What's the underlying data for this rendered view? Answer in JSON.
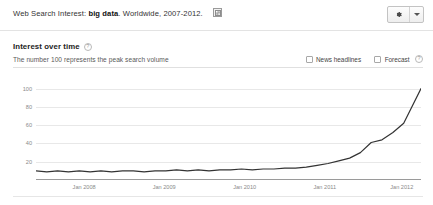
{
  "header": {
    "title_prefix": "Web Search Interest:",
    "keyword": "big data",
    "title_suffix": ". Worldwide, 2007-2012.",
    "embed_icon": "embed-image-icon",
    "gear_icon": "gear-icon",
    "caret_icon": "chevron-down-icon"
  },
  "section": {
    "title": "Interest over time",
    "help_glyph": "?",
    "subtitle": "The number 100 represents the peak search volume",
    "options": [
      {
        "label": "News headlines",
        "checked": false,
        "has_help": false
      },
      {
        "label": "Forecast",
        "checked": false,
        "has_help": true
      }
    ]
  },
  "chart_data": {
    "type": "line",
    "title": "Interest over time",
    "xlabel": "",
    "ylabel": "",
    "ylim": [
      0,
      105
    ],
    "grid": true,
    "legend": false,
    "yticks": [
      100,
      80,
      60,
      40,
      20
    ],
    "xticks": [
      "Jan 2008",
      "Jan 2009",
      "Jan 2010",
      "Jan 2011",
      "Jan 2012"
    ],
    "xtick_positions_pct": [
      12.5,
      33.3,
      54.2,
      75.0,
      95.0
    ],
    "line_color": "#333333",
    "series": [
      {
        "name": "big data",
        "x": [
          "2007-01",
          "2007-03",
          "2007-05",
          "2007-07",
          "2007-09",
          "2007-11",
          "2008-01",
          "2008-03",
          "2008-05",
          "2008-07",
          "2008-09",
          "2008-11",
          "2009-01",
          "2009-03",
          "2009-05",
          "2009-07",
          "2009-09",
          "2009-11",
          "2010-01",
          "2010-03",
          "2010-05",
          "2010-07",
          "2010-09",
          "2010-11",
          "2011-01",
          "2011-03",
          "2011-05",
          "2011-07",
          "2011-09",
          "2011-11",
          "2012-01",
          "2012-03",
          "2012-05",
          "2012-07",
          "2012-09"
        ],
        "values": [
          10,
          9,
          10,
          9,
          10,
          9,
          10,
          9,
          10,
          10,
          9,
          10,
          10,
          11,
          10,
          11,
          10,
          11,
          11,
          12,
          11,
          12,
          12,
          13,
          13,
          14,
          16,
          18,
          21,
          24,
          30,
          41,
          44,
          52,
          62
        ]
      }
    ],
    "peak_value": 100,
    "note": "Flat near 10 through 2010, hockey-stick rise from 2011 reaching the 100 peak at the right edge."
  }
}
